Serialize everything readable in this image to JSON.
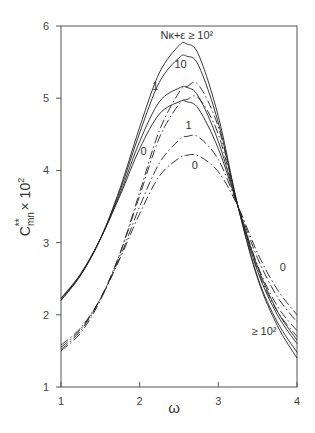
{
  "chart_data": {
    "type": "line",
    "title": "",
    "xlabel": "ω",
    "ylabel": "C**mn × 10²",
    "xlim": [
      1,
      4
    ],
    "ylim": [
      1,
      6
    ],
    "x_ticks": [
      "1",
      "2",
      "3",
      "4"
    ],
    "y_ticks": [
      "1",
      "2",
      "3",
      "4",
      "5",
      "6"
    ],
    "grid": false,
    "legend": "inline labels",
    "annotations": [
      {
        "text": "Nκ+ε ≥ 10²",
        "x": 2.6,
        "y": 5.82
      },
      {
        "text": "10",
        "x": 2.52,
        "y": 5.42
      },
      {
        "text": "1",
        "x": 2.2,
        "y": 5.12
      },
      {
        "text": "0",
        "x": 2.05,
        "y": 4.22
      },
      {
        "text": "1",
        "x": 2.62,
        "y": 4.58
      },
      {
        "text": "0",
        "x": 2.7,
        "y": 4.02
      },
      {
        "text": "0",
        "x": 3.82,
        "y": 2.6
      },
      {
        "text": "≥ 10²",
        "x": 3.58,
        "y": 1.72
      }
    ],
    "x": [
      1.0,
      1.25,
      1.5,
      1.75,
      2.0,
      2.25,
      2.5,
      2.6,
      2.75,
      3.0,
      3.25,
      3.5,
      3.75,
      4.0
    ],
    "series": [
      {
        "name": "N ≥ 10² (solid)",
        "style": "solid",
        "values": [
          2.2,
          2.55,
          3.05,
          3.75,
          4.6,
          5.35,
          5.73,
          5.75,
          5.6,
          4.75,
          3.5,
          2.5,
          1.85,
          1.4
        ]
      },
      {
        "name": "N = 10 (solid)",
        "style": "solid",
        "values": [
          2.2,
          2.55,
          3.05,
          3.72,
          4.52,
          5.22,
          5.56,
          5.58,
          5.45,
          4.66,
          3.5,
          2.52,
          1.9,
          1.48
        ]
      },
      {
        "name": "N = 1 (solid)",
        "style": "solid",
        "values": [
          2.22,
          2.56,
          3.05,
          3.68,
          4.4,
          4.95,
          5.14,
          5.15,
          5.02,
          4.4,
          3.5,
          2.6,
          2.0,
          1.6
        ]
      },
      {
        "name": "N = 0 (solid)",
        "style": "solid",
        "values": [
          2.23,
          2.57,
          3.05,
          3.65,
          4.3,
          4.78,
          4.95,
          4.95,
          4.85,
          4.3,
          3.5,
          2.66,
          2.05,
          1.65
        ]
      },
      {
        "name": "N ≥ 10² (dash-dot)",
        "style": "dashdot",
        "values": [
          1.5,
          1.75,
          2.2,
          2.85,
          3.7,
          4.55,
          5.08,
          5.16,
          5.18,
          4.6,
          3.5,
          2.62,
          2.05,
          1.7
        ]
      },
      {
        "name": "N = 10 (dash-dot)",
        "style": "dashdot",
        "values": [
          1.52,
          1.78,
          2.22,
          2.85,
          3.65,
          4.45,
          4.92,
          4.98,
          5.0,
          4.5,
          3.5,
          2.68,
          2.12,
          1.78
        ]
      },
      {
        "name": "N = 1 (dash-dot)",
        "style": "dashdot",
        "values": [
          1.55,
          1.8,
          2.22,
          2.8,
          3.5,
          4.1,
          4.42,
          4.47,
          4.46,
          4.15,
          3.5,
          2.78,
          2.25,
          1.9
        ]
      },
      {
        "name": "N = 0 (dash-dot)",
        "style": "dashdot",
        "values": [
          1.58,
          1.82,
          2.22,
          2.78,
          3.4,
          3.92,
          4.17,
          4.21,
          4.2,
          3.98,
          3.5,
          2.85,
          2.35,
          2.0
        ]
      }
    ]
  }
}
